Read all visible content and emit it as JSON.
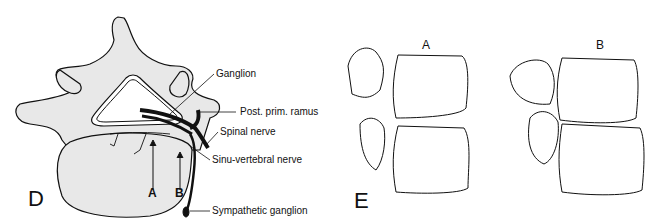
{
  "panel_d": {
    "letter": "D",
    "arrow_labels": {
      "a": "A",
      "b": "B"
    },
    "labels": {
      "ganglion": "Ganglion",
      "post_prim_ramus": "Post. prim. ramus",
      "spinal_nerve": "Spinal nerve",
      "sinu_vertebral_nerve": "Sinu-vertebral nerve",
      "sympathetic_ganglion": "Sympathetic ganglion"
    }
  },
  "panel_e": {
    "letter": "E",
    "sub_labels": {
      "a": "A",
      "b": "B"
    }
  },
  "colors": {
    "bone_fill": "#e8e8e8",
    "line": "#111111",
    "background": "#ffffff"
  }
}
